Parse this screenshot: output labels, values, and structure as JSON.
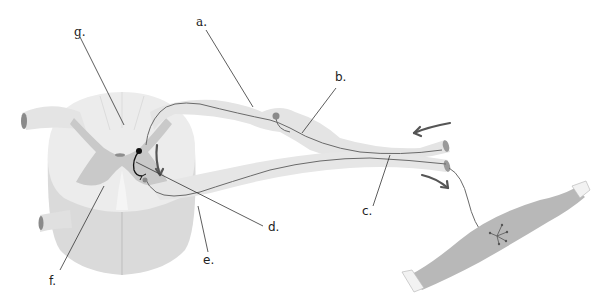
{
  "diagram": {
    "type": "reflex-arc",
    "labels": {
      "a": "a.",
      "b": "b.",
      "c": "c.",
      "d": "d.",
      "e": "e.",
      "f": "f.",
      "g": "g."
    },
    "colors": {
      "background": "#ffffff",
      "white_matter": "#ebebeb",
      "gray_matter": "#cfcfcf",
      "lower_cord": "#dcdcdc",
      "nerve": "#e6e6e6",
      "axon": "#6a6a6a",
      "muscle": "#b5b5b5",
      "tendon": "#f4f4f4",
      "arrow": "#555555",
      "leader_line": "#333333"
    }
  }
}
